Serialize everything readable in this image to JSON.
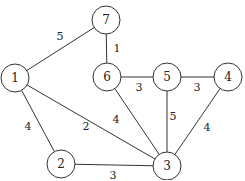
{
  "diagram": {
    "type": "weighted-undirected-graph",
    "node_radius": 14,
    "nodes": [
      {
        "id": "1",
        "label": "1",
        "x": 15,
        "y": 78
      },
      {
        "id": "2",
        "label": "2",
        "x": 61,
        "y": 164
      },
      {
        "id": "3",
        "label": "3",
        "x": 167,
        "y": 166
      },
      {
        "id": "4",
        "label": "4",
        "x": 228,
        "y": 77
      },
      {
        "id": "5",
        "label": "5",
        "x": 167,
        "y": 77
      },
      {
        "id": "6",
        "label": "6",
        "x": 107,
        "y": 77
      },
      {
        "id": "7",
        "label": "7",
        "x": 106,
        "y": 20
      }
    ],
    "edges": [
      {
        "from": "1",
        "to": "7",
        "weight": "5",
        "lx": 60,
        "ly": 36
      },
      {
        "from": "7",
        "to": "6",
        "weight": "1",
        "lx": 117,
        "ly": 48
      },
      {
        "from": "6",
        "to": "5",
        "weight": "3",
        "lx": 139,
        "ly": 87
      },
      {
        "from": "5",
        "to": "4",
        "weight": "3",
        "lx": 197,
        "ly": 87
      },
      {
        "from": "1",
        "to": "2",
        "weight": "4",
        "lx": 28,
        "ly": 126
      },
      {
        "from": "1",
        "to": "3",
        "weight": "2",
        "lx": 86,
        "ly": 126
      },
      {
        "from": "6",
        "to": "3",
        "weight": "4",
        "lx": 116,
        "ly": 119
      },
      {
        "from": "5",
        "to": "3",
        "weight": "5",
        "lx": 173,
        "ly": 116
      },
      {
        "from": "4",
        "to": "3",
        "weight": "4",
        "lx": 207,
        "ly": 127
      },
      {
        "from": "2",
        "to": "3",
        "weight": "3",
        "lx": 113,
        "ly": 175
      }
    ]
  }
}
